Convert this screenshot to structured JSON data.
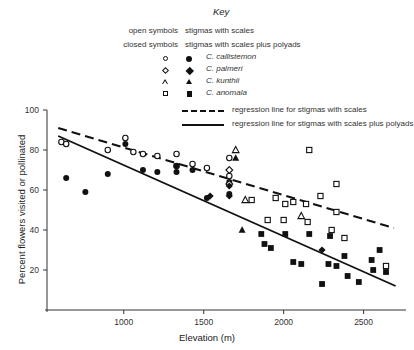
{
  "key": {
    "title": "Key",
    "rows": [
      {
        "lead": "open symbols",
        "desc": "stigmas with scales"
      },
      {
        "lead": "closed symbols",
        "desc": "stigmas with scales plus polyads"
      }
    ],
    "species": [
      {
        "open": "circle-open",
        "closed": "circle-closed",
        "name": "C. callistemon"
      },
      {
        "open": "diamond-open",
        "closed": "diamond-closed",
        "name": "C. palmeri"
      },
      {
        "open": "triangle-open",
        "closed": "triangle-closed",
        "name": "C. kunthii"
      },
      {
        "open": "square-open",
        "closed": "square-closed",
        "name": "C. anomala"
      }
    ],
    "lines": [
      {
        "style": "dashed",
        "label": "regression line for stigmas with scales"
      },
      {
        "style": "solid",
        "label": "regression line for stigmas with scales plus polyads"
      }
    ]
  },
  "chart_data": {
    "type": "scatter",
    "title": "",
    "xlabel": "Elevation (m)",
    "ylabel": "Percent flowers visited or pollinated",
    "xlim": [
      520,
      2740
    ],
    "ylim": [
      0,
      100
    ],
    "xticks": [
      1000,
      1500,
      2000,
      2500
    ],
    "yticks": [
      20,
      40,
      60,
      80,
      100
    ],
    "grid": false,
    "legend_position": "top",
    "series": [
      {
        "name": "C. callistemon open (stigmas with scales)",
        "marker": "circle-open",
        "points": [
          [
            610,
            84
          ],
          [
            640,
            83
          ],
          [
            900,
            80
          ],
          [
            1010,
            86
          ],
          [
            1060,
            79
          ],
          [
            1120,
            78
          ],
          [
            1210,
            77
          ],
          [
            1330,
            78
          ],
          [
            1330,
            72
          ],
          [
            1430,
            73
          ],
          [
            1520,
            71
          ],
          [
            1660,
            76
          ],
          [
            1660,
            67
          ]
        ]
      },
      {
        "name": "C. callistemon closed (stigmas with scales plus polyads)",
        "marker": "circle-closed",
        "points": [
          [
            640,
            66
          ],
          [
            760,
            59
          ],
          [
            900,
            68
          ],
          [
            1010,
            83
          ],
          [
            1120,
            70
          ],
          [
            1210,
            69
          ],
          [
            1330,
            72
          ],
          [
            1330,
            69
          ],
          [
            1430,
            70
          ],
          [
            1520,
            56
          ],
          [
            1660,
            64
          ],
          [
            1660,
            58
          ]
        ]
      },
      {
        "name": "C. palmeri open",
        "marker": "diamond-open",
        "points": [
          [
            1660,
            70
          ],
          [
            1660,
            63
          ]
        ]
      },
      {
        "name": "C. palmeri closed",
        "marker": "diamond-closed",
        "points": [
          [
            1540,
            57
          ],
          [
            1660,
            62
          ],
          [
            1660,
            57
          ],
          [
            2240,
            30
          ]
        ]
      },
      {
        "name": "C. kunthii open",
        "marker": "triangle-open",
        "points": [
          [
            1700,
            80
          ],
          [
            1760,
            55
          ],
          [
            2110,
            47
          ]
        ]
      },
      {
        "name": "C. kunthii closed",
        "marker": "triangle-closed",
        "points": [
          [
            1700,
            76
          ],
          [
            1740,
            40
          ]
        ]
      },
      {
        "name": "C. anomala open",
        "marker": "square-open",
        "points": [
          [
            1800,
            55
          ],
          [
            1950,
            56
          ],
          [
            2010,
            53
          ],
          [
            2060,
            54
          ],
          [
            2140,
            53
          ],
          [
            2230,
            57
          ],
          [
            2160,
            80
          ],
          [
            2330,
            49
          ],
          [
            2330,
            63
          ],
          [
            1900,
            45
          ],
          [
            2000,
            45
          ],
          [
            2150,
            44
          ],
          [
            2300,
            40
          ],
          [
            2380,
            36
          ],
          [
            2640,
            22
          ]
        ]
      },
      {
        "name": "C. anomala closed",
        "marker": "square-closed",
        "points": [
          [
            1860,
            38
          ],
          [
            1880,
            33
          ],
          [
            1920,
            31
          ],
          [
            2010,
            38
          ],
          [
            2060,
            24
          ],
          [
            2110,
            23
          ],
          [
            2160,
            38
          ],
          [
            2280,
            23
          ],
          [
            2290,
            37
          ],
          [
            2330,
            22
          ],
          [
            2380,
            27
          ],
          [
            2400,
            17
          ],
          [
            2550,
            25
          ],
          [
            2600,
            30
          ],
          [
            2560,
            20
          ],
          [
            2640,
            19
          ],
          [
            2470,
            14
          ],
          [
            2240,
            13
          ]
        ]
      }
    ],
    "regression_lines": [
      {
        "name": "stigmas with scales",
        "style": "dashed",
        "x": [
          590,
          2690
        ],
        "y": [
          91,
          41
        ]
      },
      {
        "name": "stigmas with scales plus polyads",
        "style": "solid",
        "x": [
          590,
          2700
        ],
        "y": [
          87,
          12
        ]
      }
    ]
  }
}
